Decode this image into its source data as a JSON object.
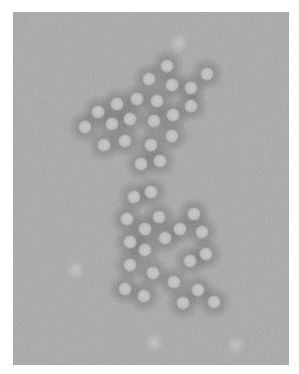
{
  "image": {
    "description": "Negative-stain electron micrograph of clustered spherical virus particles on grey background",
    "background_color": "#a8a8a8",
    "particle_color": "#c2c2c2",
    "stain_color": "#5a5a5a",
    "frame": {
      "x": 13,
      "y": 12,
      "width": 276,
      "height": 353
    },
    "particles": [
      [
        167,
        66
      ],
      [
        207,
        74
      ],
      [
        149,
        79
      ],
      [
        172,
        85
      ],
      [
        191,
        88
      ],
      [
        137,
        99
      ],
      [
        157,
        101
      ],
      [
        191,
        106
      ],
      [
        98,
        112
      ],
      [
        117,
        104
      ],
      [
        130,
        119
      ],
      [
        154,
        121
      ],
      [
        173,
        115
      ],
      [
        85,
        127
      ],
      [
        112,
        124
      ],
      [
        172,
        136
      ],
      [
        104,
        145
      ],
      [
        125,
        141
      ],
      [
        151,
        145
      ],
      [
        141,
        164
      ],
      [
        160,
        161
      ],
      [
        134,
        197
      ],
      [
        151,
        192
      ],
      [
        127,
        219
      ],
      [
        159,
        217
      ],
      [
        194,
        214
      ],
      [
        145,
        229
      ],
      [
        180,
        229
      ],
      [
        202,
        232
      ],
      [
        165,
        238
      ],
      [
        130,
        242
      ],
      [
        145,
        250
      ],
      [
        206,
        254
      ],
      [
        190,
        261
      ],
      [
        130,
        265
      ],
      [
        153,
        273
      ],
      [
        174,
        282
      ],
      [
        125,
        289
      ],
      [
        198,
        290
      ],
      [
        144,
        296
      ],
      [
        183,
        303
      ],
      [
        214,
        302
      ]
    ],
    "faint_spots": [
      [
        179,
        43
      ],
      [
        154,
        343
      ],
      [
        236,
        345
      ],
      [
        76,
        270
      ]
    ]
  }
}
